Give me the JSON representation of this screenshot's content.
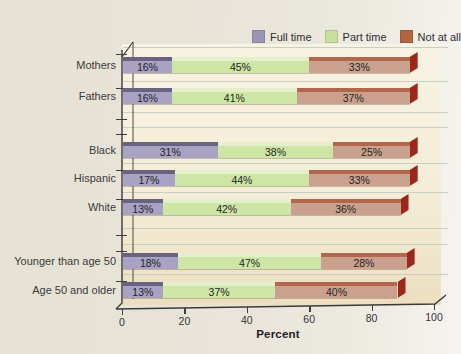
{
  "figure": {
    "legend": {
      "items": [
        {
          "label": "Full time",
          "color": "#9c96b5"
        },
        {
          "label": "Part time",
          "color": "#c7e09f"
        },
        {
          "label": "Not at all",
          "color": "#b2663f"
        }
      ]
    }
  },
  "chart_data": {
    "type": "bar",
    "orientation": "horizontal",
    "stacked": true,
    "title": "",
    "xlabel": "Percent",
    "ylabel": "",
    "xlim": [
      0,
      100
    ],
    "xticks": [
      0,
      20,
      40,
      60,
      80,
      100
    ],
    "grid": "horizontal",
    "legend_position": "top",
    "categories": [
      "Mothers",
      "Fathers",
      "Black",
      "Hispanic",
      "White",
      "Younger than age 50",
      "Age 50 and older"
    ],
    "category_groups": [
      [
        "Mothers",
        "Fathers"
      ],
      [
        "Black",
        "Hispanic",
        "White"
      ],
      [
        "Younger than age 50",
        "Age 50 and older"
      ]
    ],
    "series": [
      {
        "name": "Full time",
        "fill": "#a8a2c3",
        "edge": "#696281",
        "values": [
          16,
          16,
          31,
          17,
          13,
          18,
          13
        ]
      },
      {
        "name": "Part time",
        "fill": "#cde6a6",
        "edge": "#e3f0cb",
        "values": [
          45,
          41,
          38,
          44,
          42,
          47,
          37
        ]
      },
      {
        "name": "Not at all",
        "fill": "#c9a18e",
        "edge": "#b2664c",
        "values": [
          33,
          37,
          25,
          33,
          36,
          28,
          40
        ]
      }
    ],
    "bar_end_cap_color": "#9b281b",
    "value_labels": [
      [
        "16%",
        "45%",
        "33%"
      ],
      [
        "16%",
        "41%",
        "37%"
      ],
      [
        "31%",
        "38%",
        "25%"
      ],
      [
        "17%",
        "44%",
        "33%"
      ],
      [
        "13%",
        "42%",
        "36%"
      ],
      [
        "18%",
        "47%",
        "28%"
      ],
      [
        "13%",
        "37%",
        "40%"
      ]
    ]
  }
}
